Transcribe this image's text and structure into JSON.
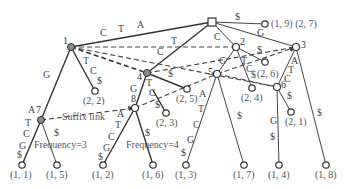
{
  "figure": {
    "type": "generalized-suffix-tree",
    "annotations": {
      "suffix_link": "Suffix link",
      "frequency_left": "Frequency=3",
      "frequency_right": "Frequency=4"
    },
    "root": {
      "shape": "square"
    },
    "internal_nodes": [
      {
        "id": "1",
        "label": "1",
        "fill": "#8a8a8a"
      },
      {
        "id": "2",
        "label": "2",
        "fill": "#ffffff"
      },
      {
        "id": "3",
        "label": "3",
        "fill": "#ffffff"
      },
      {
        "id": "4",
        "label": "4",
        "fill": "#8a8a8a"
      },
      {
        "id": "5",
        "label": "5",
        "fill": "#ffffff"
      },
      {
        "id": "6",
        "label": "6",
        "fill": "#ffffff"
      },
      {
        "id": "7",
        "label": "7",
        "fill": "#8a8a8a"
      },
      {
        "id": "8",
        "label": "8",
        "fill": "#ffffff"
      }
    ],
    "leaves": [
      {
        "id": "l19",
        "label": "(1, 9) (2, 7)"
      },
      {
        "id": "l22",
        "label": "(2, 2)"
      },
      {
        "id": "l25",
        "label": "(2, 5)"
      },
      {
        "id": "l23",
        "label": "(2, 3)"
      },
      {
        "id": "l26",
        "label": "(2, 6)"
      },
      {
        "id": "l24",
        "label": "(2, 4)"
      },
      {
        "id": "l21",
        "label": "(2, 1)"
      },
      {
        "id": "l11",
        "label": "(1, 1)"
      },
      {
        "id": "l15",
        "label": "(1, 5)"
      },
      {
        "id": "l12",
        "label": "(1, 2)"
      },
      {
        "id": "l16",
        "label": "(1, 6)"
      },
      {
        "id": "l13",
        "label": "(1, 3)"
      },
      {
        "id": "l17",
        "label": "(1, 7)"
      },
      {
        "id": "l14",
        "label": "(1, 4)"
      },
      {
        "id": "l18",
        "label": "(1, 8)"
      }
    ],
    "edge_labels": {
      "root_1": [
        "C",
        "T",
        "A"
      ],
      "root_4": [
        "C",
        "T"
      ],
      "root_2": "C",
      "root_3": "G",
      "root_leaf19": "$",
      "n1_7": "G",
      "n1_leaf22": [
        "T",
        "C",
        "$"
      ],
      "n4_8": "G",
      "n4_leaf23": [
        "T",
        "C",
        "$"
      ],
      "n4_leaf25": "$",
      "n2_5": "G",
      "n2_leaf24": [
        "T",
        "C",
        "$"
      ],
      "n2_leaf26": "$",
      "n3_6": [
        "A",
        "T",
        "C"
      ],
      "n3_leaf18": "$",
      "n6_leaf21": "$",
      "n6_leaf14": [
        "G",
        "$"
      ],
      "n5_leaf13": [
        "A",
        "T",
        "C",
        "G",
        "$"
      ],
      "n5_leaf17": "$",
      "n7_leaf11": [
        "A",
        "T",
        "C",
        "G",
        "$"
      ],
      "n7_leaf15": "$",
      "n8_leaf12": [
        "A",
        "T",
        "C",
        "G",
        "$"
      ],
      "n8_leaf16": "$"
    }
  }
}
